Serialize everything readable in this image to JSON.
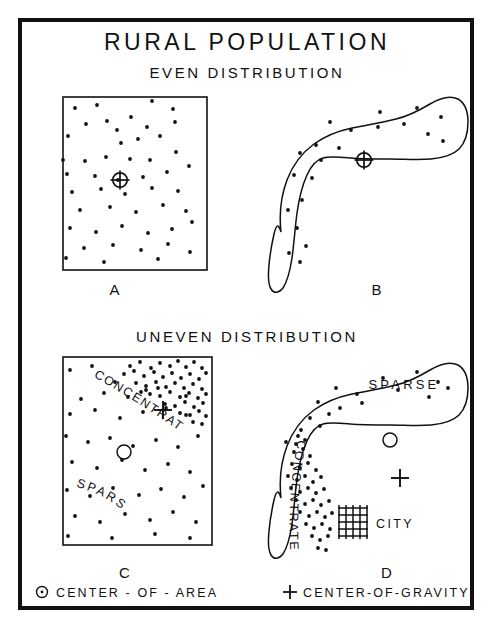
{
  "figure": {
    "title": "RURAL POPULATION",
    "subtitle_even": "EVEN DISTRIBUTION",
    "subtitle_uneven": "UNEVEN DISTRIBUTION",
    "frame_color": "#111111",
    "ink_color": "#111111",
    "background": "#ffffff"
  },
  "panels": {
    "a": {
      "label": "A",
      "shape": "square",
      "distribution": "even",
      "marker": "center-of-gravity-circled-cross"
    },
    "b": {
      "label": "B",
      "shape": "irregular-boomerang",
      "distribution": "even",
      "marker": "center-of-gravity-circled-cross"
    },
    "c": {
      "label": "C",
      "shape": "square",
      "distribution": "uneven",
      "annotation_dense": "CONCENTRATED",
      "annotation_sparse": "SPARSE",
      "marker_area": "center-of-area-circle",
      "marker_gravity": "center-of-gravity-plus"
    },
    "d": {
      "label": "D",
      "shape": "irregular-boomerang",
      "distribution": "uneven",
      "annotation_dense": "CONCENTRATED",
      "annotation_sparse": "SPARSE",
      "annotation_city": "CITY",
      "marker_area": "center-of-area-circle",
      "marker_gravity": "center-of-gravity-plus"
    }
  },
  "legend": {
    "center_of_area": "CENTER - OF - AREA",
    "center_of_gravity": "CENTER-OF-GRAVITY",
    "symbol_area": "circle",
    "symbol_gravity": "plus"
  },
  "chart_data": {
    "type": "scatter",
    "title": "RURAL POPULATION",
    "panel_a_dots": [
      [
        75,
        108
      ],
      [
        97,
        105
      ],
      [
        152,
        101
      ],
      [
        173,
        109
      ],
      [
        86,
        124
      ],
      [
        107,
        121
      ],
      [
        131,
        117
      ],
      [
        147,
        127
      ],
      [
        175,
        122
      ],
      [
        68,
        136
      ],
      [
        117,
        130
      ],
      [
        121,
        143
      ],
      [
        138,
        139
      ],
      [
        160,
        136
      ],
      [
        63,
        160
      ],
      [
        85,
        161
      ],
      [
        106,
        157
      ],
      [
        130,
        159
      ],
      [
        150,
        160
      ],
      [
        176,
        152
      ],
      [
        67,
        174
      ],
      [
        95,
        176
      ],
      [
        118,
        180
      ],
      [
        143,
        177
      ],
      [
        167,
        172
      ],
      [
        189,
        166
      ],
      [
        72,
        192
      ],
      [
        101,
        189
      ],
      [
        125,
        194
      ],
      [
        152,
        188
      ],
      [
        178,
        191
      ],
      [
        80,
        210
      ],
      [
        110,
        207
      ],
      [
        136,
        212
      ],
      [
        163,
        205
      ],
      [
        186,
        211
      ],
      [
        70,
        228
      ],
      [
        96,
        232
      ],
      [
        122,
        226
      ],
      [
        148,
        233
      ],
      [
        172,
        229
      ],
      [
        192,
        222
      ],
      [
        84,
        248
      ],
      [
        113,
        245
      ],
      [
        141,
        250
      ],
      [
        168,
        244
      ],
      [
        190,
        252
      ],
      [
        66,
        258
      ],
      [
        104,
        262
      ],
      [
        158,
        259
      ]
    ],
    "panel_b_dots": [
      [
        380,
        112
      ],
      [
        417,
        108
      ],
      [
        441,
        117
      ],
      [
        330,
        122
      ],
      [
        351,
        130
      ],
      [
        378,
        127
      ],
      [
        404,
        124
      ],
      [
        428,
        134
      ],
      [
        443,
        141
      ],
      [
        316,
        145
      ],
      [
        339,
        148
      ],
      [
        300,
        153
      ],
      [
        321,
        160
      ],
      [
        294,
        175
      ],
      [
        312,
        178
      ],
      [
        302,
        200
      ],
      [
        288,
        210
      ],
      [
        297,
        228
      ],
      [
        306,
        246
      ],
      [
        289,
        253
      ],
      [
        300,
        262
      ]
    ],
    "panel_c_dots_sparse": [
      [
        70,
        370
      ],
      [
        92,
        366
      ],
      [
        115,
        382
      ],
      [
        81,
        399
      ],
      [
        104,
        393
      ],
      [
        128,
        397
      ],
      [
        146,
        390
      ],
      [
        70,
        414
      ],
      [
        95,
        410
      ],
      [
        120,
        418
      ],
      [
        143,
        412
      ],
      [
        166,
        408
      ],
      [
        186,
        415
      ],
      [
        66,
        436
      ],
      [
        88,
        442
      ],
      [
        110,
        438
      ],
      [
        133,
        446
      ],
      [
        156,
        440
      ],
      [
        178,
        447
      ],
      [
        198,
        436
      ],
      [
        72,
        462
      ],
      [
        97,
        468
      ],
      [
        122,
        460
      ],
      [
        145,
        470
      ],
      [
        168,
        464
      ],
      [
        190,
        472
      ],
      [
        67,
        490
      ],
      [
        90,
        496
      ],
      [
        113,
        488
      ],
      [
        139,
        495
      ],
      [
        161,
        489
      ],
      [
        184,
        497
      ],
      [
        203,
        486
      ],
      [
        75,
        516
      ],
      [
        100,
        522
      ],
      [
        125,
        514
      ],
      [
        150,
        520
      ],
      [
        173,
        512
      ],
      [
        196,
        522
      ],
      [
        68,
        536
      ],
      [
        112,
        538
      ],
      [
        155,
        534
      ],
      [
        190,
        538
      ]
    ],
    "panel_c_dots_dense": [
      [
        130,
        366
      ],
      [
        140,
        362
      ],
      [
        151,
        368
      ],
      [
        160,
        363
      ],
      [
        170,
        366
      ],
      [
        178,
        361
      ],
      [
        186,
        367
      ],
      [
        194,
        362
      ],
      [
        202,
        368
      ],
      [
        124,
        374
      ],
      [
        134,
        371
      ],
      [
        144,
        376
      ],
      [
        154,
        372
      ],
      [
        163,
        377
      ],
      [
        172,
        373
      ],
      [
        181,
        378
      ],
      [
        190,
        374
      ],
      [
        199,
        379
      ],
      [
        206,
        373
      ],
      [
        136,
        383
      ],
      [
        146,
        386
      ],
      [
        156,
        382
      ],
      [
        166,
        387
      ],
      [
        175,
        383
      ],
      [
        184,
        388
      ],
      [
        193,
        384
      ],
      [
        202,
        389
      ],
      [
        150,
        394
      ],
      [
        160,
        396
      ],
      [
        170,
        392
      ],
      [
        180,
        397
      ],
      [
        189,
        393
      ],
      [
        198,
        398
      ],
      [
        206,
        394
      ],
      [
        165,
        404
      ],
      [
        175,
        406
      ],
      [
        185,
        402
      ],
      [
        194,
        407
      ],
      [
        203,
        403
      ],
      [
        180,
        413
      ],
      [
        190,
        415
      ],
      [
        199,
        411
      ],
      [
        206,
        416
      ],
      [
        193,
        422
      ],
      [
        202,
        424
      ],
      [
        186,
        396
      ],
      [
        158,
        388
      ],
      [
        141,
        392
      ]
    ],
    "panel_d_dots_sparse": [
      [
        383,
        378
      ],
      [
        417,
        372
      ],
      [
        438,
        382
      ],
      [
        336,
        388
      ],
      [
        357,
        394
      ],
      [
        398,
        390
      ],
      [
        429,
        397
      ],
      [
        448,
        388
      ],
      [
        318,
        402
      ],
      [
        340,
        408
      ],
      [
        362,
        403
      ],
      [
        310,
        418
      ],
      [
        329,
        414
      ],
      [
        301,
        430
      ],
      [
        320,
        426
      ],
      [
        296,
        444
      ]
    ],
    "panel_d_dots_dense": [
      [
        294,
        452
      ],
      [
        303,
        449
      ],
      [
        310,
        456
      ],
      [
        292,
        464
      ],
      [
        300,
        468
      ],
      [
        308,
        463
      ],
      [
        316,
        470
      ],
      [
        288,
        476
      ],
      [
        297,
        480
      ],
      [
        305,
        476
      ],
      [
        313,
        482
      ],
      [
        321,
        477
      ],
      [
        291,
        488
      ],
      [
        300,
        492
      ],
      [
        308,
        488
      ],
      [
        316,
        493
      ],
      [
        324,
        489
      ],
      [
        296,
        500
      ],
      [
        305,
        504
      ],
      [
        313,
        500
      ],
      [
        321,
        505
      ],
      [
        329,
        501
      ],
      [
        300,
        512
      ],
      [
        309,
        516
      ],
      [
        317,
        512
      ],
      [
        325,
        517
      ],
      [
        332,
        513
      ],
      [
        306,
        524
      ],
      [
        314,
        528
      ],
      [
        322,
        524
      ],
      [
        330,
        529
      ],
      [
        312,
        536
      ],
      [
        320,
        540
      ],
      [
        328,
        536
      ],
      [
        318,
        548
      ],
      [
        326,
        550
      ],
      [
        286,
        442
      ],
      [
        298,
        436
      ],
      [
        305,
        440
      ]
    ],
    "markers": {
      "panel_a_cog": [
        120,
        180
      ],
      "panel_b_cog": [
        364,
        160
      ],
      "panel_c_coa": [
        124,
        452
      ],
      "panel_c_cog": [
        163,
        410
      ],
      "panel_d_coa": [
        390,
        440
      ],
      "panel_d_cog": [
        400,
        478
      ]
    }
  }
}
